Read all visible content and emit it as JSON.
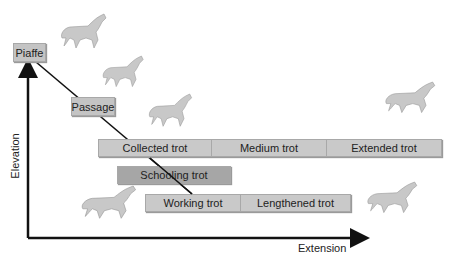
{
  "diagram": {
    "axes": {
      "y_label": "Elevation",
      "x_label": "Extension"
    },
    "gaits": {
      "piaffe": "Piaffe",
      "passage": "Passage",
      "schooling": "Schooling trot"
    },
    "top_row": [
      "Collected trot",
      "Medium trot",
      "Extended trot"
    ],
    "bottom_row": [
      "Working trot",
      "Lengthened trot"
    ],
    "horse_icons": [
      "piaffe-horse",
      "passage-horse",
      "collected-horse",
      "extended-horse",
      "working-horse",
      "lengthened-horse"
    ],
    "colors": {
      "box": "#c9c9c9",
      "schooling_box": "#a6a6a6",
      "horse": "#c8c8c8",
      "line": "#111111"
    }
  }
}
